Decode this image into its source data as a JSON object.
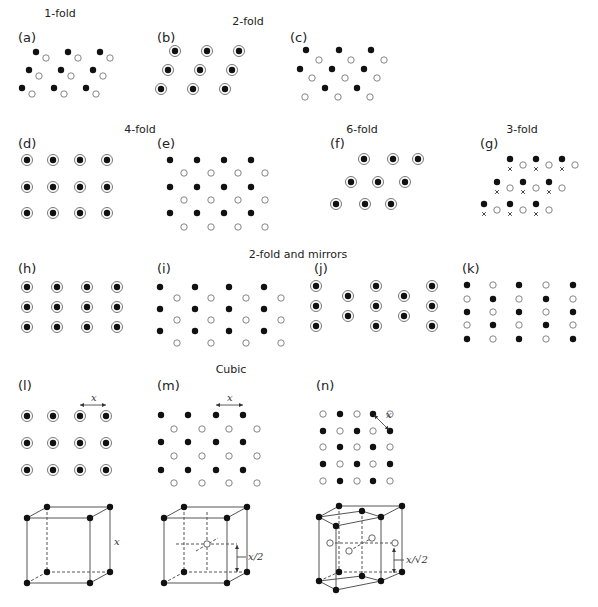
{
  "figure": {
    "section_titles": [
      {
        "id": "1fold",
        "text": "1-fold",
        "x": 60,
        "y": 17
      },
      {
        "id": "2fold",
        "text": "2-fold",
        "x": 248,
        "y": 25
      },
      {
        "id": "4fold",
        "text": "4-fold",
        "x": 140,
        "y": 133
      },
      {
        "id": "6fold",
        "text": "6-fold",
        "x": 362,
        "y": 133
      },
      {
        "id": "3fold",
        "text": "3-fold",
        "x": 522,
        "y": 133
      },
      {
        "id": "2fold_mirrors",
        "text": "2-fold and mirrors",
        "x": 298,
        "y": 258
      },
      {
        "id": "cubic",
        "text": "Cubic",
        "x": 231,
        "y": 373
      }
    ],
    "panels": [
      {
        "id": "a",
        "label": "(a)",
        "lx": 18,
        "ly": 42
      },
      {
        "id": "b",
        "label": "(b)",
        "lx": 157,
        "ly": 42
      },
      {
        "id": "c",
        "label": "(c)",
        "lx": 290,
        "ly": 42
      },
      {
        "id": "d",
        "label": "(d)",
        "lx": 18,
        "ly": 148
      },
      {
        "id": "e",
        "label": "(e)",
        "lx": 157,
        "ly": 148
      },
      {
        "id": "f",
        "label": "(f)",
        "lx": 330,
        "ly": 148
      },
      {
        "id": "g",
        "label": "(g)",
        "lx": 480,
        "ly": 148
      },
      {
        "id": "h",
        "label": "(h)",
        "lx": 18,
        "ly": 273
      },
      {
        "id": "i",
        "label": "(i)",
        "lx": 157,
        "ly": 273
      },
      {
        "id": "j",
        "label": "(j)",
        "lx": 314,
        "ly": 273
      },
      {
        "id": "k",
        "label": "(k)",
        "lx": 462,
        "ly": 273
      },
      {
        "id": "l",
        "label": "(l)",
        "lx": 18,
        "ly": 390
      },
      {
        "id": "m",
        "label": "(m)",
        "lx": 157,
        "ly": 390
      },
      {
        "id": "n",
        "label": "(n)",
        "lx": 316,
        "ly": 390
      }
    ],
    "annotations": {
      "l_spacing": "x",
      "m_spacing": "x",
      "n_spacing": "x",
      "cube_l_edge": "x",
      "cube_m_height": "x/2",
      "cube_n_height": "x/√2"
    },
    "legend": {
      "filled_circle": "atom above plane",
      "open_circle": "atom below plane",
      "ring_dot": "coincident filled and open atoms",
      "cross": "third position"
    },
    "colors": {
      "ink": "#111111",
      "line": "#555555",
      "open": "#777777"
    }
  }
}
